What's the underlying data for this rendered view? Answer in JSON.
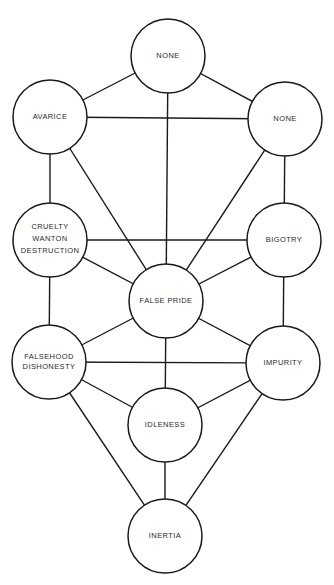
{
  "diagram": {
    "title": "",
    "colors": {
      "line": "#1a1a1a",
      "text": "#2a2a2a",
      "background": "#ffffff"
    },
    "nodes": [
      {
        "id": "top",
        "label_lines": [
          "NONE"
        ],
        "cx": 168,
        "cy": 56,
        "r": 37
      },
      {
        "id": "avarice",
        "label_lines": [
          "AVARICE"
        ],
        "cx": 50,
        "cy": 117,
        "r": 37
      },
      {
        "id": "none_right",
        "label_lines": [
          "NONE"
        ],
        "cx": 285,
        "cy": 119,
        "r": 37
      },
      {
        "id": "cruelty",
        "label_lines": [
          "CRUELTY",
          "WANTON",
          "DESTRUCTION"
        ],
        "cx": 50,
        "cy": 240,
        "r": 37
      },
      {
        "id": "bigotry",
        "label_lines": [
          "BIGOTRY"
        ],
        "cx": 284,
        "cy": 240,
        "r": 37
      },
      {
        "id": "false_pride",
        "label_lines": [
          "FALSE  PRIDE"
        ],
        "cx": 166,
        "cy": 301,
        "r": 37
      },
      {
        "id": "falsehood",
        "label_lines": [
          "FALSEHOOD",
          "DISHONESTY"
        ],
        "cx": 49,
        "cy": 362,
        "r": 37
      },
      {
        "id": "impurity",
        "label_lines": [
          "IMPURITY"
        ],
        "cx": 283,
        "cy": 363,
        "r": 37
      },
      {
        "id": "idleness",
        "label_lines": [
          "IDLENESS"
        ],
        "cx": 165,
        "cy": 425,
        "r": 37
      },
      {
        "id": "inertia",
        "label_lines": [
          "INERTIA"
        ],
        "cx": 165,
        "cy": 536,
        "r": 37
      }
    ],
    "edges": [
      [
        "top",
        "avarice"
      ],
      [
        "top",
        "none_right"
      ],
      [
        "top",
        "false_pride"
      ],
      [
        "avarice",
        "none_right"
      ],
      [
        "avarice",
        "cruelty"
      ],
      [
        "avarice",
        "false_pride"
      ],
      [
        "none_right",
        "bigotry"
      ],
      [
        "none_right",
        "false_pride"
      ],
      [
        "cruelty",
        "bigotry"
      ],
      [
        "cruelty",
        "false_pride"
      ],
      [
        "cruelty",
        "falsehood"
      ],
      [
        "bigotry",
        "false_pride"
      ],
      [
        "bigotry",
        "impurity"
      ],
      [
        "false_pride",
        "falsehood"
      ],
      [
        "false_pride",
        "impurity"
      ],
      [
        "false_pride",
        "idleness"
      ],
      [
        "falsehood",
        "impurity"
      ],
      [
        "falsehood",
        "idleness"
      ],
      [
        "falsehood",
        "inertia"
      ],
      [
        "impurity",
        "idleness"
      ],
      [
        "impurity",
        "inertia"
      ],
      [
        "idleness",
        "inertia"
      ]
    ]
  }
}
